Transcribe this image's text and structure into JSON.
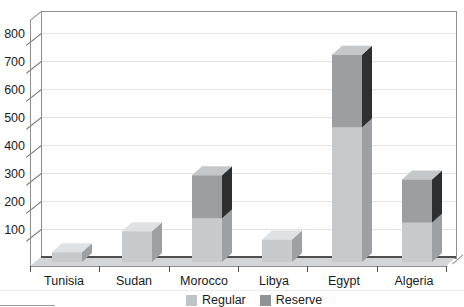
{
  "chart_data": {
    "type": "bar",
    "style": "3d-stacked",
    "title": "",
    "xlabel": "",
    "ylabel": "",
    "categories": [
      "Tunisia",
      "Sudan",
      "Morocco",
      "Libya",
      "Egypt",
      "Algeria"
    ],
    "series": [
      {
        "name": "Regular",
        "values": [
          35,
          110,
          155,
          80,
          480,
          140
        ]
      },
      {
        "name": "Reserve",
        "values": [
          0,
          0,
          155,
          0,
          260,
          155
        ]
      }
    ],
    "y_ticks": [
      100,
      200,
      300,
      400,
      500,
      600,
      700,
      800
    ],
    "ylim": [
      0,
      875
    ],
    "grid": true,
    "legend_position": "bottom-center"
  },
  "legend": {
    "items": [
      {
        "label": "Regular",
        "color": "#c0c4c7"
      },
      {
        "label": "Reserve",
        "color": "#8f9396"
      }
    ]
  },
  "colors": {
    "regular": {
      "front": "#c6cacd",
      "top": "#dfe2e4",
      "side": "#9da1a4"
    },
    "reserve": {
      "front": "#9b9fa2",
      "top": "#c4c8ca",
      "side": "#2d2f31"
    },
    "wall_border": "#8f8f8f",
    "gridline": "#e3e3e3",
    "floor_fill": "#d3d6d8",
    "floor_back_edge": "#4f4f4f",
    "axis_line": "#8f8f8f",
    "tick": "#6a6a6a",
    "scan_rule": "#ececec"
  }
}
